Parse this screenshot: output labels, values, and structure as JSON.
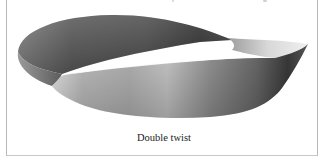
{
  "figure": {
    "caption": "Double twist",
    "colors": {
      "frame_border": "#b8b8b8",
      "band_dark": "#3c3c3c",
      "band_mid": "#8a8a8a",
      "band_light": "#e6e6e6",
      "caption_text": "#1a1a1a"
    }
  }
}
